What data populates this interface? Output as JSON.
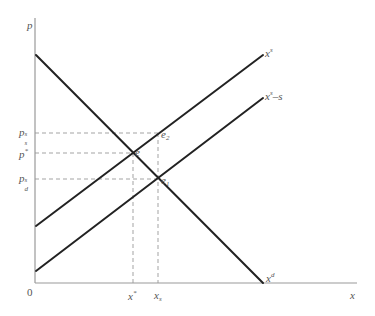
{
  "axes": {
    "y_label": "p",
    "x_label": "x",
    "origin_label": "0"
  },
  "curves": {
    "supply": {
      "label": "x",
      "label_sup": "s"
    },
    "supply_subsidy": {
      "label": "x",
      "label_sup": "s",
      "label_suffix": "–s"
    },
    "demand": {
      "label": "x",
      "label_sup": "d"
    }
  },
  "points": {
    "e": "e",
    "e1": {
      "base": "e",
      "sub": "1"
    },
    "e2": {
      "base": "e",
      "sub": "2"
    }
  },
  "y_ticks": {
    "ps_s": {
      "base": "p",
      "sup": "s",
      "sub": "s"
    },
    "p_star": {
      "base": "p",
      "sup": "*"
    },
    "pd_s": {
      "base": "p",
      "sup": "s",
      "sub": "d"
    }
  },
  "x_ticks": {
    "x_star": {
      "base": "x",
      "sup": "*"
    },
    "x_s": {
      "base": "x",
      "sub": "s"
    }
  },
  "colors": {
    "curve": "#222222",
    "axis": "#888888",
    "dash": "#999999"
  }
}
